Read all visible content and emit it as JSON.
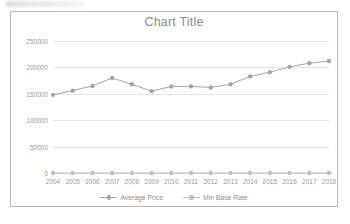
{
  "chart_data": {
    "type": "line",
    "title": "Chart Title",
    "xlabel": "",
    "ylabel": "",
    "ylim": [
      0,
      250000
    ],
    "yticks": [
      0,
      50000,
      100000,
      150000,
      200000,
      250000
    ],
    "ytick_labels": [
      "0",
      "50000",
      "100000",
      "150000",
      "200000",
      "250000"
    ],
    "grid": true,
    "legend_position": "bottom",
    "categories": [
      "2004",
      "2005",
      "2006",
      "2007",
      "2008",
      "2009",
      "2010",
      "2011",
      "2012",
      "2013",
      "2014",
      "2015",
      "2016",
      "2017",
      "2018"
    ],
    "series": [
      {
        "name": "Average Price",
        "color": "#a6a6a6",
        "marker": "circle",
        "values": [
          148000,
          156000,
          165000,
          180000,
          168000,
          155000,
          164000,
          164000,
          162000,
          168000,
          183000,
          191000,
          201000,
          208000,
          212000
        ]
      },
      {
        "name": "Min Base Rate",
        "color": "#bfbfbf",
        "marker": "circle",
        "values": [
          4.4,
          4.7,
          4.6,
          5.0,
          5.0,
          0.5,
          0.5,
          0.5,
          0.5,
          0.5,
          0.5,
          0.5,
          0.4,
          0.3,
          0.5
        ]
      }
    ]
  },
  "frame": {
    "border_color": "#b9b9b9",
    "background": "#ffffff"
  }
}
